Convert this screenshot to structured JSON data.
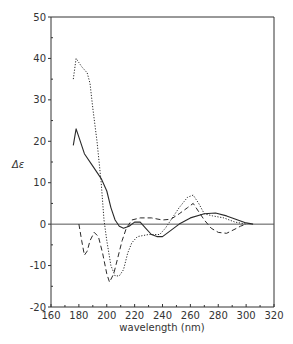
{
  "chart_data": {
    "type": "line",
    "title": "",
    "xlabel": "wavelength  (nm)",
    "ylabel": "Δε",
    "xlim": [
      160,
      320
    ],
    "ylim": [
      -20,
      50
    ],
    "xticks": [
      160,
      180,
      200,
      220,
      240,
      260,
      280,
      300,
      320
    ],
    "yticks": [
      -20,
      -10,
      0,
      10,
      20,
      30,
      40,
      50
    ],
    "grid": false,
    "legend": null,
    "zero_line": true,
    "series": [
      {
        "name": "solid",
        "style": "solid",
        "points": [
          [
            176,
            19
          ],
          [
            178,
            23
          ],
          [
            180,
            21
          ],
          [
            184,
            17
          ],
          [
            190,
            14
          ],
          [
            196,
            11
          ],
          [
            200,
            8
          ],
          [
            203,
            4
          ],
          [
            206,
            1
          ],
          [
            209,
            -0.5
          ],
          [
            212,
            -1
          ],
          [
            216,
            -0.5
          ],
          [
            220,
            0.5
          ],
          [
            224,
            0.5
          ],
          [
            228,
            -1
          ],
          [
            232,
            -2.5
          ],
          [
            236,
            -3
          ],
          [
            240,
            -3
          ],
          [
            246,
            -1.5
          ],
          [
            252,
            0
          ],
          [
            260,
            1.5
          ],
          [
            270,
            2.5
          ],
          [
            278,
            2.7
          ],
          [
            286,
            2
          ],
          [
            294,
            1
          ],
          [
            300,
            0.3
          ],
          [
            305,
            0
          ]
        ]
      },
      {
        "name": "dotted",
        "style": "dotted",
        "points": [
          [
            176,
            35
          ],
          [
            178,
            40
          ],
          [
            180,
            39
          ],
          [
            182,
            38
          ],
          [
            186,
            36.5
          ],
          [
            188,
            34
          ],
          [
            190,
            28
          ],
          [
            193,
            20
          ],
          [
            196,
            10
          ],
          [
            198,
            1
          ],
          [
            200,
            -4
          ],
          [
            203,
            -10
          ],
          [
            206,
            -12.5
          ],
          [
            209,
            -12.5
          ],
          [
            212,
            -11
          ],
          [
            215,
            -7
          ],
          [
            218,
            -4.5
          ],
          [
            222,
            -3
          ],
          [
            230,
            -2.5
          ],
          [
            238,
            -2.5
          ],
          [
            242,
            -1
          ],
          [
            246,
            1
          ],
          [
            252,
            4
          ],
          [
            258,
            6.5
          ],
          [
            262,
            7
          ],
          [
            266,
            5
          ],
          [
            270,
            2.5
          ],
          [
            276,
            2
          ],
          [
            284,
            1.5
          ],
          [
            292,
            0.5
          ],
          [
            300,
            0
          ]
        ]
      },
      {
        "name": "dashed",
        "style": "dashed",
        "points": [
          [
            180,
            0
          ],
          [
            182,
            -4
          ],
          [
            184,
            -7.5
          ],
          [
            186,
            -6.5
          ],
          [
            188,
            -4
          ],
          [
            191,
            -2
          ],
          [
            194,
            -3
          ],
          [
            197,
            -7
          ],
          [
            200,
            -12
          ],
          [
            202,
            -14
          ],
          [
            205,
            -12
          ],
          [
            208,
            -8
          ],
          [
            211,
            -4
          ],
          [
            214,
            -1
          ],
          [
            218,
            1
          ],
          [
            224,
            1.5
          ],
          [
            232,
            1.5
          ],
          [
            240,
            1
          ],
          [
            246,
            1.2
          ],
          [
            252,
            2.5
          ],
          [
            258,
            4
          ],
          [
            262,
            5
          ],
          [
            266,
            3
          ],
          [
            270,
            1
          ],
          [
            275,
            -1
          ],
          [
            280,
            -2
          ],
          [
            286,
            -2.2
          ],
          [
            292,
            -1.2
          ],
          [
            296,
            -0.5
          ],
          [
            300,
            0
          ]
        ]
      }
    ]
  }
}
